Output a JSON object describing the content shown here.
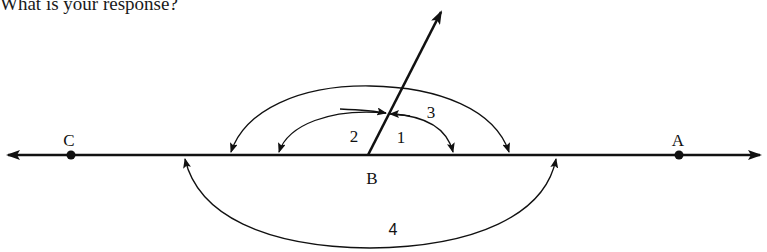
{
  "prompt": "What is your response?",
  "diagram": {
    "points": [
      {
        "label": "C",
        "x": 71,
        "y": 155,
        "label_x": 69,
        "label_y": 140
      },
      {
        "label": "B",
        "x": 368,
        "y": 155,
        "label_x": 372,
        "label_y": 178
      },
      {
        "label": "A",
        "x": 679,
        "y": 155,
        "label_x": 678,
        "label_y": 140
      }
    ],
    "angle_labels": [
      {
        "label": "1",
        "x": 401,
        "y": 137
      },
      {
        "label": "2",
        "x": 354,
        "y": 136
      },
      {
        "label": "3",
        "x": 431,
        "y": 112
      },
      {
        "label": "4",
        "x": 393,
        "y": 230
      }
    ],
    "line": {
      "y": 155,
      "x_start": 8,
      "x_end": 760
    },
    "ray": {
      "x1": 368,
      "y1": 155,
      "x2": 441,
      "y2": 12
    },
    "colors": {
      "stroke": "#111111",
      "background": "#ffffff"
    }
  }
}
